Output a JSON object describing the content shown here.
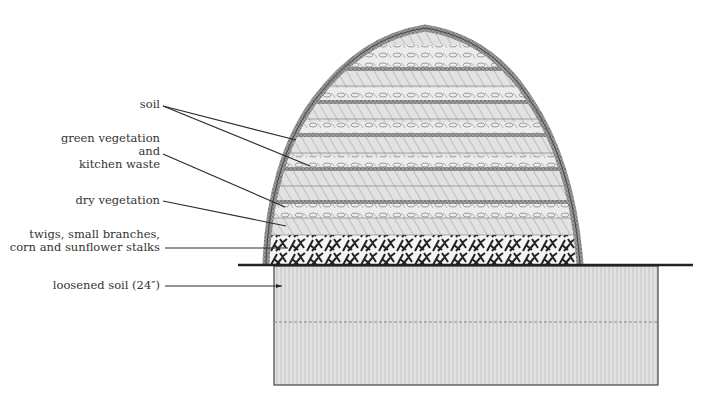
{
  "labels": {
    "soil": "soil",
    "green_line1": "green vegetation",
    "green_line2": "and",
    "green_line3": "kitchen waste",
    "dry": "dry vegetation",
    "twigs_line1": "twigs, small branches,",
    "twigs_line2": "corn and sunflower stalks",
    "loosened": "loosened soil (24″)"
  },
  "colors": {
    "ink": "#2b2b2b",
    "soil_band": "#8a8a8a",
    "green_layer": "#d8d8d8",
    "dry_layer": "#c4c4c4",
    "twig_layer": "#3a3a3a",
    "loosened_soil": "#cfcfcf",
    "background": "#ffffff"
  },
  "layers_bottom_to_top": [
    "loosened soil (24″)",
    "twigs, small branches, corn and sunflower stalks",
    "dry vegetation",
    "green vegetation and kitchen waste",
    "soil",
    "dry vegetation",
    "green vegetation and kitchen waste",
    "soil",
    "dry vegetation",
    "green vegetation and kitchen waste",
    "soil",
    "dry vegetation",
    "green vegetation and kitchen waste",
    "soil",
    "dry vegetation",
    "green vegetation and kitchen waste",
    "soil cover"
  ]
}
